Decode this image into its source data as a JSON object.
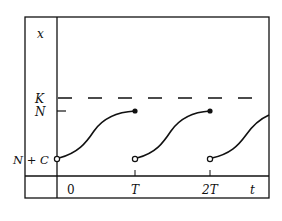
{
  "diagram": {
    "y_axis_label": "x",
    "x_axis_label": "t",
    "y_ticks": [
      {
        "label": "K",
        "y": 98,
        "style": "dashed-line"
      },
      {
        "label": "N",
        "y": 111,
        "style": "tick"
      },
      {
        "label": "N + C",
        "y": 159,
        "style": "open-circle"
      }
    ],
    "x_ticks": [
      {
        "label": "0",
        "x": 57
      },
      {
        "label": "T",
        "x": 135
      },
      {
        "label": "2T",
        "x": 210
      }
    ],
    "segments": [
      {
        "start": "N + C",
        "end": "N",
        "from_t": "0",
        "to_t": "T"
      },
      {
        "start": "N + C",
        "end": "N",
        "from_t": "T",
        "to_t": "2T"
      },
      {
        "start": "N + C",
        "end": "continues",
        "from_t": "2T",
        "to_t": "t"
      }
    ],
    "colors": {
      "ink": "#111111",
      "background": "#ffffff"
    }
  }
}
